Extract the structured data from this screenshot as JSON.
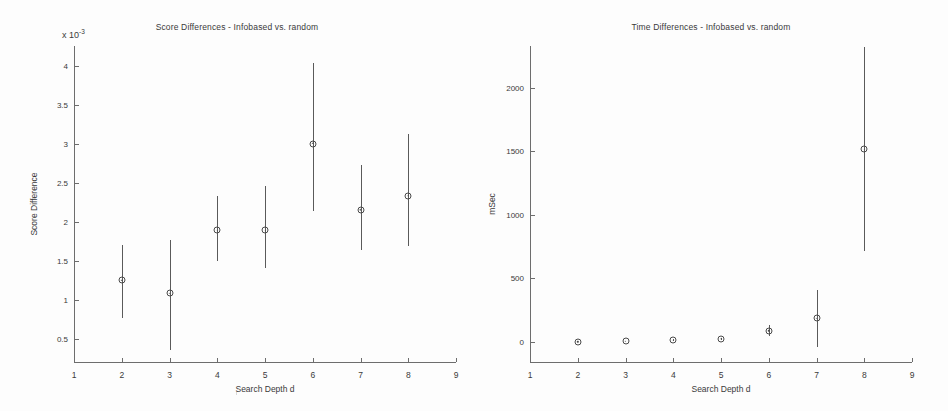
{
  "figure": {
    "width": 948,
    "height": 411,
    "background": "#fdfdfd",
    "axis_color": "#6d6d6d",
    "data_color": "#4a4a4a"
  },
  "chart_data": [
    {
      "id": "score-differences",
      "type": "scatter",
      "title": "Score Differences - Infobased vs. random",
      "xlabel": "Search Depth d",
      "ylabel": "Score Difference",
      "y_exponent_label": "x 10",
      "y_exponent_value": "-3",
      "xlim": [
        1,
        9
      ],
      "ylim": [
        0.2,
        4.25
      ],
      "xticks": [
        1,
        2,
        3,
        4,
        5,
        6,
        7,
        8,
        9
      ],
      "yticks": [
        0.5,
        1,
        1.5,
        2,
        2.5,
        3,
        3.5,
        4
      ],
      "xtick_labels": [
        "1",
        "2",
        "3",
        "4",
        "5",
        "6",
        "7",
        "8",
        "9"
      ],
      "ytick_labels": [
        "0.5",
        "1",
        "1.5",
        "2",
        "2.5",
        "3",
        "3.5",
        "4"
      ],
      "grid": false,
      "legend": "none",
      "x": [
        2,
        3,
        4,
        5,
        6,
        7,
        8
      ],
      "values": [
        1.25,
        1.08,
        1.89,
        1.89,
        3.0,
        2.15,
        2.33
      ],
      "err_low": [
        0.77,
        0.36,
        1.49,
        1.41,
        2.14,
        1.64,
        1.69
      ],
      "err_high": [
        1.7,
        1.76,
        2.33,
        2.46,
        4.03,
        2.72,
        3.12
      ]
    },
    {
      "id": "time-differences",
      "type": "scatter",
      "title": "Time Differences - Infobased vs. random",
      "xlabel": "Search Depth d",
      "ylabel": "mSec",
      "xlim": [
        1,
        9
      ],
      "ylim": [
        -160,
        2330
      ],
      "xticks": [
        1,
        2,
        3,
        4,
        5,
        6,
        7,
        8,
        9
      ],
      "yticks": [
        0,
        500,
        1000,
        1500,
        2000
      ],
      "xtick_labels": [
        "1",
        "2",
        "3",
        "4",
        "5",
        "6",
        "7",
        "8",
        "9"
      ],
      "ytick_labels": [
        "0",
        "500",
        "1000",
        "1500",
        "2000"
      ],
      "grid": false,
      "legend": "none",
      "x": [
        2,
        3,
        4,
        5,
        6,
        7,
        8
      ],
      "values": [
        0,
        3,
        12,
        23,
        85,
        185,
        1515
      ],
      "err_low": [
        0,
        2,
        8,
        16,
        42,
        -40,
        715
      ],
      "err_high": [
        1,
        5,
        18,
        32,
        128,
        405,
        2320
      ]
    }
  ]
}
